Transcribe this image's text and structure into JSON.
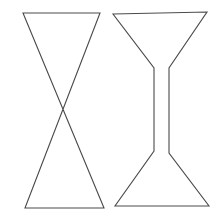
{
  "figure": {
    "background_color": "#ffffff",
    "stroke_color": "#4a4a4a",
    "stroke_width": 1.1,
    "canvas": {
      "width": 223,
      "height": 219
    },
    "shapes": [
      {
        "id": "bowtie-left",
        "name": "crossed-bowtie-outline",
        "description": "Two triangles meeting at a central crossing point, drawn as a single crossed quadrilateral (bowtie / hourglass with crossed diagonals).",
        "closed": true,
        "points": [
          [
            23,
            13
          ],
          [
            100,
            13
          ],
          [
            25,
            208
          ],
          [
            104,
            208
          ]
        ],
        "crossing_point": [
          62,
          111
        ]
      },
      {
        "id": "hourglass-right",
        "name": "hourglass-outline",
        "description": "Hourglass silhouette: wide top trapezoid tapering into a narrow vertical neck, then flaring into a wide bottom trapezoid.",
        "closed": true,
        "points": [
          [
            113,
            14
          ],
          [
            207,
            12
          ],
          [
            169,
            68
          ],
          [
            169,
            153
          ],
          [
            209,
            206
          ],
          [
            115,
            206
          ],
          [
            154,
            151
          ],
          [
            154,
            68
          ]
        ],
        "neck": {
          "left_x": 154,
          "right_x": 169,
          "top_y": 68,
          "bottom_y": 152
        }
      }
    ]
  }
}
